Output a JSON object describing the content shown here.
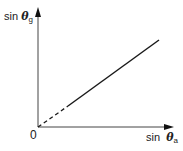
{
  "diagram": {
    "y_axis_label": {
      "prefix": "sin ",
      "symbol": "θ",
      "subscript": "g"
    },
    "x_axis_label": {
      "prefix": "sin  ",
      "symbol": "θ",
      "subscript": "a"
    },
    "origin_label": "0",
    "line": {
      "style_near_origin": "dashed",
      "style_main": "solid",
      "color": "#1a1a1a"
    },
    "axis_color": "#333333"
  }
}
